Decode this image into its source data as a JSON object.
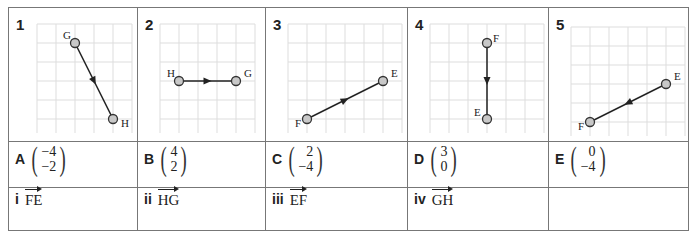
{
  "panels": [
    {
      "number": "1",
      "start": {
        "label": "G",
        "x": 2,
        "y": 1
      },
      "end": {
        "label": "H",
        "x": 4,
        "y": 5
      }
    },
    {
      "number": "2",
      "start": {
        "label": "H",
        "x": 1,
        "y": 3
      },
      "end": {
        "label": "G",
        "x": 4,
        "y": 3
      }
    },
    {
      "number": "3",
      "start": {
        "label": "F",
        "x": 1,
        "y": 5
      },
      "end": {
        "label": "E",
        "x": 5,
        "y": 3
      }
    },
    {
      "number": "4",
      "start": {
        "label": "F",
        "x": 3,
        "y": 1
      },
      "end": {
        "label": "E",
        "x": 3,
        "y": 5
      }
    },
    {
      "number": "5",
      "start": {
        "label": "E",
        "x": 5,
        "y": 3
      },
      "end": {
        "label": "F",
        "x": 1,
        "y": 5
      }
    }
  ],
  "column_vectors": [
    {
      "letter": "A",
      "top": "−4",
      "bottom": "−2"
    },
    {
      "letter": "B",
      "top": "4",
      "bottom": "2"
    },
    {
      "letter": "C",
      "top": "2",
      "bottom": "−4"
    },
    {
      "letter": "D",
      "top": "3",
      "bottom": "0"
    },
    {
      "letter": "E",
      "top": "0",
      "bottom": "−4"
    }
  ],
  "named_vectors": [
    {
      "numeral": "i",
      "name": "FE"
    },
    {
      "numeral": "ii",
      "name": "HG"
    },
    {
      "numeral": "iii",
      "name": "EF"
    },
    {
      "numeral": "iv",
      "name": "GH"
    },
    {
      "numeral": "",
      "name": ""
    }
  ]
}
